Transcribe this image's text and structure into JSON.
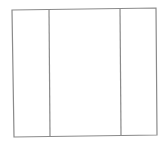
{
  "diagram": {
    "type": "three-column-box",
    "stroke_color": "#8a8a8a",
    "background": "#ffffff",
    "outer_box": {
      "top_left": [
        12,
        10
      ],
      "top_right": [
        156,
        8
      ],
      "bottom_right": [
        157,
        135
      ],
      "bottom_left": [
        14,
        137
      ]
    },
    "dividers": [
      {
        "top": [
          49,
          9
        ],
        "bottom": [
          50,
          136
        ]
      },
      {
        "top": [
          120,
          8
        ],
        "bottom": [
          121,
          135
        ]
      }
    ],
    "columns": [
      {
        "label": ""
      },
      {
        "label": ""
      },
      {
        "label": ""
      }
    ]
  }
}
